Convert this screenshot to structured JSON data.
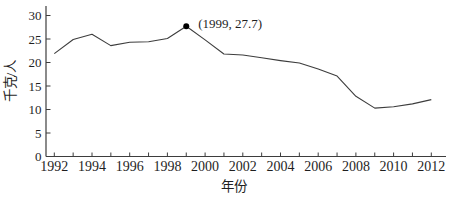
{
  "figure": {
    "background": "#ffffff"
  },
  "chart_data": {
    "type": "line",
    "x": [
      1992,
      1993,
      1994,
      1995,
      1996,
      1997,
      1998,
      1999,
      2000,
      2001,
      2002,
      2003,
      2004,
      2005,
      2006,
      2007,
      2008,
      2009,
      2010,
      2011,
      2012
    ],
    "series": [
      {
        "name": "per-capita-amount",
        "values": [
          21.9,
          24.9,
          26.0,
          23.6,
          24.3,
          24.4,
          25.1,
          27.7,
          24.8,
          21.8,
          21.6,
          21.0,
          20.4,
          19.9,
          18.6,
          17.1,
          12.8,
          10.3,
          10.6,
          11.2,
          12.1
        ]
      }
    ],
    "title": "",
    "xlabel": "年份",
    "ylabel": "千克/人",
    "xlim": [
      1992,
      2012
    ],
    "ylim": [
      0,
      30
    ],
    "yticks": [
      0,
      5,
      10,
      15,
      20,
      25,
      30
    ],
    "xtick_years": [
      1992,
      1993,
      1994,
      1995,
      1996,
      1997,
      1998,
      1999,
      2000,
      2001,
      2002,
      2003,
      2004,
      2005,
      2006,
      2007,
      2008,
      2009,
      2010,
      2011,
      2012
    ],
    "xtick_labels": [
      "1992",
      "1994",
      "1996",
      "1998",
      "2000",
      "2002",
      "2004",
      "2006",
      "2008",
      "2010",
      "2012"
    ],
    "xtick_labeled_years": [
      1992,
      1994,
      1996,
      1998,
      2000,
      2002,
      2004,
      2006,
      2008,
      2010,
      2012
    ],
    "grid": false,
    "legend": null,
    "annotation": {
      "year": 1999,
      "value": 27.7,
      "label": "(1999, 27.7)",
      "marker": "filled-circle",
      "marker_color": "#000000"
    },
    "colors": {
      "line": "#3d3d3d",
      "axis": "#3d3d3d",
      "text": "#1f1f1f"
    }
  }
}
